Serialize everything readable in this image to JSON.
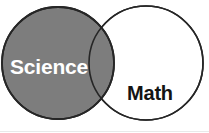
{
  "figure": {
    "type": "venn-diagram",
    "width": 209,
    "height": 133,
    "background_color": "#ffffff",
    "title": ""
  },
  "sets": [
    {
      "id": "science",
      "label": "Science",
      "fill_color": "#7d7d7d",
      "stroke_color": "#262626",
      "label_color": "#ffffff",
      "center_x": 58,
      "center_y": 63,
      "radius": 56
    },
    {
      "id": "math",
      "label": "Math",
      "fill_color": "#ffffff",
      "stroke_color": "#262626",
      "label_color": "#141414",
      "center_x": 146,
      "center_y": 63,
      "radius": 57
    }
  ],
  "intersection": {
    "label": "",
    "fill_color": "#7d7d7d",
    "stroke_color": "#262626"
  },
  "labels": {
    "science_x": 10,
    "science_y": 74,
    "math_x": 127,
    "math_y": 100
  }
}
